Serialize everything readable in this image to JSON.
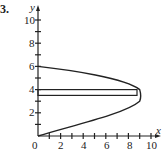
{
  "problem_number": "3.",
  "axes": {
    "x_label": "x",
    "y_label": "y",
    "x_ticks": [
      "0",
      "2",
      "4",
      "6",
      "8",
      "10"
    ],
    "y_ticks": [
      "2",
      "4",
      "6",
      "8",
      "10"
    ]
  },
  "curve": {
    "equation": "x = 6y - y^2",
    "vertex": [
      9,
      3
    ],
    "y_intercepts": [
      0,
      6
    ]
  },
  "strip": {
    "x_range": [
      0,
      8.75
    ],
    "y_range": [
      3.5,
      4.0
    ]
  },
  "colors": {
    "line": "#222222",
    "background": "#ffffff"
  }
}
